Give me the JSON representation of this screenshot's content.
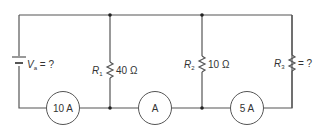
{
  "diagram": {
    "type": "parallel-circuit",
    "source": {
      "symbol": "V",
      "subscript": "a",
      "value": "= ?"
    },
    "resistors": [
      {
        "symbol": "R",
        "subscript": "1",
        "value": "40 Ω"
      },
      {
        "symbol": "R",
        "subscript": "2",
        "value": "10 Ω"
      },
      {
        "symbol": "R",
        "subscript": "3",
        "value": "= ?"
      }
    ],
    "ammeters": [
      {
        "label": "10 A"
      },
      {
        "label": "A"
      },
      {
        "label": "5 A"
      }
    ],
    "colors": {
      "wire": "#555555",
      "text": "#333333",
      "background": "#ffffff"
    }
  }
}
